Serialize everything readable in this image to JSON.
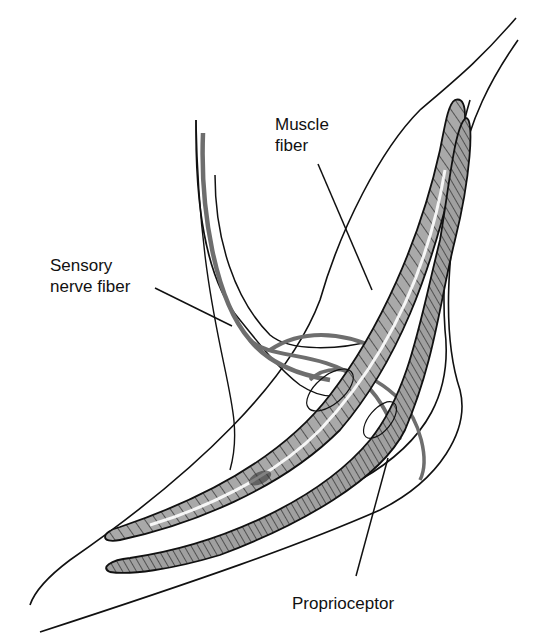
{
  "diagram": {
    "type": "anatomical-illustration",
    "colors": {
      "outline": "#111111",
      "nerve_fiber": "#6e6e6e",
      "muscle_fill": "#a9a9a9",
      "background": "#ffffff"
    },
    "labels": {
      "muscle_fiber": {
        "line1": "Muscle",
        "line2": "fiber"
      },
      "sensory_nerve_fiber": {
        "line1": "Sensory",
        "line2": "nerve fiber"
      },
      "proprioceptor": {
        "line1": "Proprioceptor"
      }
    }
  }
}
